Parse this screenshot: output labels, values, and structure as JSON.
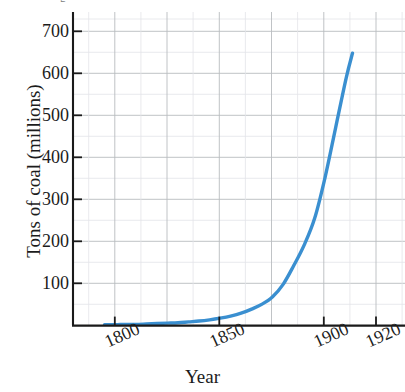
{
  "figure": {
    "background_color": "#ffffff",
    "clipped_text_above": "g"
  },
  "axis": {
    "x_label": "Year",
    "y_label": "Tons of coal (millions)",
    "y_ticks": [
      "100",
      "200",
      "300",
      "400",
      "500",
      "600",
      "700"
    ],
    "x_ticks": [
      "1800",
      "1850",
      "1900",
      "1920"
    ]
  },
  "colors": {
    "line": "#3a8fd0",
    "grid_major": "#b9bcc0",
    "grid_minor": "#dfe1e4",
    "axis": "#1a1a1a",
    "text": "#1c1c1c"
  },
  "chart_data": {
    "type": "line",
    "title": "",
    "subtitle": "",
    "xlabel": "Year",
    "ylabel": "Tons of coal (millions)",
    "xlim": [
      1785,
      1943
    ],
    "ylim": [
      0,
      760
    ],
    "xticks": [
      1800,
      1850,
      1900,
      1920
    ],
    "xticklabels": [
      "1800",
      "1850",
      "1900",
      "1920"
    ],
    "yticks": [
      100,
      200,
      300,
      400,
      500,
      600,
      700
    ],
    "yticklabels": [
      "100",
      "200",
      "300",
      "400",
      "500",
      "600",
      "700"
    ],
    "grid": true,
    "grid_major_x_step": 25,
    "grid_major_y_step": 100,
    "grid_minor_y_step": 50,
    "legend": null,
    "legend_position": "none",
    "series": [
      {
        "name": "Tons of coal (millions)",
        "color": "#3a8fd0",
        "line_width": 3.4,
        "markers": false,
        "x": [
          1800,
          1805,
          1810,
          1815,
          1820,
          1825,
          1830,
          1835,
          1840,
          1845,
          1850,
          1855,
          1860,
          1865,
          1870,
          1875,
          1880,
          1885,
          1890,
          1895,
          1900,
          1905,
          1910,
          1915,
          1918
        ],
        "y": [
          2,
          2,
          3,
          3,
          4,
          5,
          6,
          7,
          9,
          11,
          14,
          18,
          23,
          30,
          40,
          52,
          70,
          100,
          145,
          195,
          260,
          360,
          480,
          600,
          660
        ]
      }
    ],
    "annotations": []
  }
}
